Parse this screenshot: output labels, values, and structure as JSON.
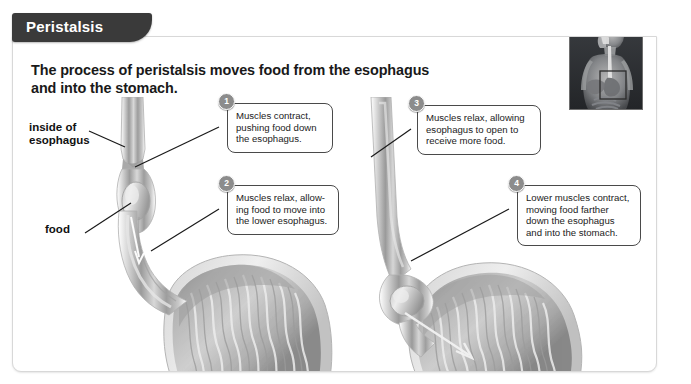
{
  "banner": {
    "title": "Peristalsis"
  },
  "heading": {
    "line1": "The process of peristalsis moves food from the esophagus",
    "line2": "and into the stomach."
  },
  "labels": [
    {
      "id": "inside-of-esophagus",
      "line1": "inside of",
      "line2": "esophagus"
    },
    {
      "id": "food",
      "line1": "food",
      "line2": ""
    }
  ],
  "callouts": [
    {
      "number": "1",
      "lines": [
        "Muscles contract,",
        "pushing food down",
        "the esophagus."
      ]
    },
    {
      "number": "2",
      "lines": [
        "Muscles relax, allow-",
        "ing food to move into",
        "the lower esophagus."
      ]
    },
    {
      "number": "3",
      "lines": [
        "Muscles relax, allowing",
        "esophagus to open to",
        "receive more food."
      ]
    },
    {
      "number": "4",
      "lines": [
        "Lower muscles contract,",
        "moving food farther",
        "down the esophagus",
        "and into the stomach."
      ]
    }
  ],
  "figures": [
    {
      "id": "left-figure",
      "alt": "Esophagus constricted above food bolus with stomach below"
    },
    {
      "id": "right-figure",
      "alt": "Food bolus at lower esophagus entering the stomach"
    }
  ],
  "inset": {
    "id": "body-locator-inset",
    "alt": "Human torso showing esophagus and stomach location"
  },
  "colors": {
    "banner_bg": "#3a3a3a",
    "banner_text": "#ffffff",
    "card_bg": "#ffffff",
    "card_border": "#d8d8d8",
    "heading_text": "#191919",
    "callout_border": "#4a4a4a",
    "badge_bg": "#8c8c8c",
    "leader_line": "#1a1a1a",
    "tissue_light": "#e9e9e9",
    "tissue_mid": "#b9b9b9",
    "tissue_dark": "#8e8e8e",
    "inset_bg": "#2e3033"
  }
}
